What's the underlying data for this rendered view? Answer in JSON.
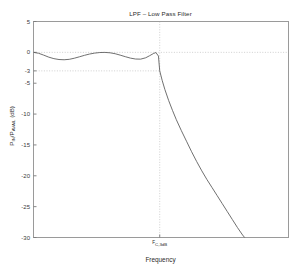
{
  "chart_data": {
    "type": "line",
    "title": "LPF – Low Pass Filter",
    "xlabel": "Frequency",
    "ylabel_text": "P_IN/P_AVAIL (dB)",
    "ylabel_main": "P",
    "ylabel_sub1": "IN",
    "ylabel_mid": "/P",
    "ylabel_sub2": "AVAIL",
    "ylabel_end": " (dB)",
    "ylim": [
      -30,
      5
    ],
    "xlim": [
      0,
      1
    ],
    "yticks": [
      5,
      0,
      -3,
      -5,
      -10,
      -15,
      -20,
      -25,
      -30
    ],
    "ytick_labels": [
      "5",
      "0",
      "-3",
      "-5",
      "-10",
      "-15",
      "-20",
      "-25",
      "-30"
    ],
    "xticks": [
      0.495
    ],
    "xtick_labels": [
      "F_C,3dB"
    ],
    "grid": false,
    "legend": null,
    "reference_lines": [
      {
        "name": "zero-db-line",
        "axis": "y",
        "value": 0,
        "style": "dotted",
        "span": "full"
      },
      {
        "name": "minus-3db-line",
        "axis": "y",
        "value": -3,
        "style": "dotted",
        "span": "to-cutoff"
      },
      {
        "name": "cutoff-frequency-line",
        "axis": "x",
        "value": 0.495,
        "style": "dotted",
        "span": "full"
      }
    ],
    "annotations": [
      {
        "name": "cutoff-frequency-tick-label",
        "text_prefix": "F",
        "text_sub": "C,3dB",
        "x": 0.495
      }
    ],
    "series": [
      {
        "name": "lpf-magnitude-response",
        "color": "#606060",
        "x": [
          0.0,
          0.02,
          0.04,
          0.06,
          0.08,
          0.1,
          0.12,
          0.14,
          0.16,
          0.18,
          0.2,
          0.22,
          0.24,
          0.26,
          0.28,
          0.3,
          0.32,
          0.34,
          0.36,
          0.38,
          0.4,
          0.42,
          0.44,
          0.455,
          0.47,
          0.48,
          0.49,
          0.495,
          0.505,
          0.515,
          0.53,
          0.545,
          0.56,
          0.58,
          0.6,
          0.62,
          0.64,
          0.66,
          0.68,
          0.7,
          0.72,
          0.74,
          0.76,
          0.78,
          0.8,
          0.82,
          0.84
        ],
        "y": [
          0.0,
          -0.15,
          -0.45,
          -0.78,
          -1.02,
          -1.16,
          -1.2,
          -1.13,
          -0.95,
          -0.72,
          -0.48,
          -0.27,
          -0.12,
          -0.03,
          -0.01,
          -0.07,
          -0.22,
          -0.45,
          -0.7,
          -0.93,
          -1.08,
          -1.1,
          -0.88,
          -0.55,
          -0.2,
          -0.03,
          -0.6,
          -3.0,
          -4.6,
          -6.0,
          -7.8,
          -9.4,
          -10.9,
          -12.7,
          -14.4,
          -16.1,
          -17.7,
          -19.2,
          -20.6,
          -21.9,
          -23.2,
          -24.5,
          -25.8,
          -27.1,
          -28.4,
          -29.6,
          -30.6
        ]
      }
    ]
  },
  "axes": {
    "box_color": "#9a9a9a",
    "tick_color": "#7a7a7a",
    "dotted_color": "#c4c4c4"
  }
}
